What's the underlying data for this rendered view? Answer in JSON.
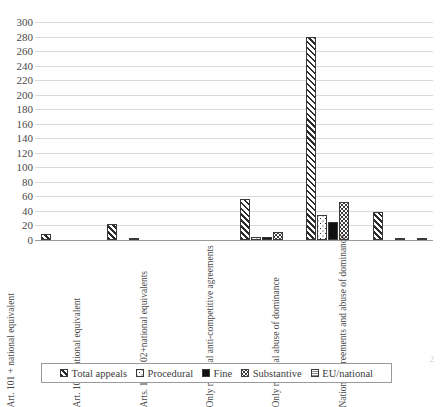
{
  "chart_data": {
    "type": "bar",
    "title": "",
    "xlabel": "",
    "ylabel": "",
    "ylim": [
      0,
      300
    ],
    "ytick_step": 20,
    "yticks": [
      300,
      280,
      260,
      240,
      220,
      200,
      180,
      160,
      140,
      120,
      100,
      80,
      60,
      40,
      20,
      0
    ],
    "grid": true,
    "legend_position": "bottom",
    "categories": [
      "Art. 101 + national equivalent",
      "Art. 102+national equivalent",
      "Arts. 101+102+national equivalents",
      "Only national anti-competitive agreements",
      "Only national abuse of dominance",
      "National agreements and abuse of dominance"
    ],
    "series": [
      {
        "name": "Total appeals",
        "pattern": "diagonal-hatch",
        "values": [
          8,
          22,
          0,
          57,
          280,
          38
        ]
      },
      {
        "name": "Procedural",
        "pattern": "coarse-dots",
        "values": [
          0,
          0,
          0,
          4,
          35,
          0
        ]
      },
      {
        "name": "Fine",
        "pattern": "solid-black",
        "values": [
          0,
          1,
          0,
          4,
          25,
          1
        ]
      },
      {
        "name": "Substantive",
        "pattern": "fine-dots",
        "values": [
          0,
          0,
          0,
          11,
          52,
          0
        ]
      },
      {
        "name": "EU/national",
        "pattern": "grey-grid",
        "values": [
          0,
          0,
          0,
          0,
          0,
          3
        ]
      }
    ]
  },
  "legend": {
    "items": [
      {
        "label": "Total appeals",
        "swatch": "diagonal-hatch-swatch"
      },
      {
        "label": "Procedural",
        "swatch": "coarse-dots-swatch"
      },
      {
        "label": "Fine",
        "swatch": "solid-black-swatch"
      },
      {
        "label": "Substantive",
        "swatch": "fine-dots-swatch"
      },
      {
        "label": "EU/national",
        "swatch": "grey-grid-swatch"
      }
    ]
  },
  "page": {
    "caption_sliver": "",
    "page_number": "2"
  },
  "colors": {
    "axis": "#9a9a9a",
    "gridline": "#d9d9d9",
    "text": "#3b3b3b",
    "bar_outline": "#3a3a3a",
    "fine_fill": "#111111",
    "eu_fill": "#8a8a8a"
  }
}
